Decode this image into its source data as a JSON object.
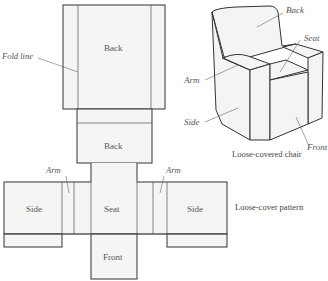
{
  "pattern": {
    "caption": "Loose-cover pattern",
    "panels": {
      "back_upper": "Back",
      "back_lower": "Back",
      "seat": "Seat",
      "side_left": "Side",
      "side_right": "Side",
      "front": "Front"
    },
    "callouts": {
      "fold_line": "Fold line",
      "arm_left": "Arm",
      "arm_right": "Arm"
    }
  },
  "chair": {
    "caption": "Loose-covered chair",
    "callouts": {
      "back": "Back",
      "seat": "Seat",
      "arm": "Arm",
      "side": "Side",
      "front": "Front"
    }
  },
  "colors": {
    "line": "#333333",
    "fill": "#f4f4f4",
    "text": "#555555"
  }
}
